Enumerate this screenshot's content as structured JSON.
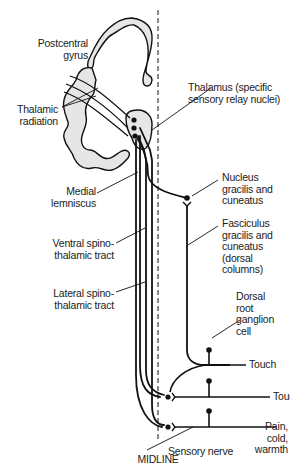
{
  "diagram": {
    "midline_label": "MIDLINE",
    "labels": {
      "postcentral_gyrus": "Postcentral\ngyrus",
      "thalamic_radiation": "Thalamic\nradiation",
      "thalamus": "Thalamus (specific\nsensory relay nuclei)",
      "medial_lemniscus": "Medial\nlemniscus",
      "nucleus_gracilis": "Nucleus\ngracilis and\ncuneatus",
      "ventral_spinothalamic": "Ventral spino-\nthalamic tract",
      "fasciculus_gracilis": "Fasciculus\ngracilis and\ncuneatus\n(dorsal\ncolumns)",
      "lateral_spinothalamic": "Lateral spino-\nthalamic tract",
      "dorsal_root_ganglion": "Dorsal\nroot\nganglion\ncell",
      "touch_1": "Touch",
      "touch_2": "Touch",
      "pain_cold_warmth": "Pain,\ncold,\nwarmth",
      "sensory_nerve": "Sensory nerve"
    },
    "colors": {
      "line": "#111111",
      "cortex_fill": "#e6e6e6",
      "text": "#222222"
    }
  }
}
